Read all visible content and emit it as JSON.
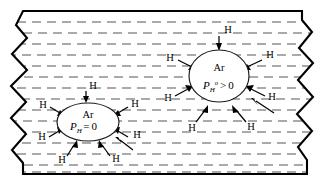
{
  "figure": {
    "colors": {
      "background": "#ffffff",
      "slab_outline": "#000000",
      "dash_line": "#8e8e8e",
      "bubble_fill": "#ffffff",
      "bubble_outline": "#1a1a1a",
      "arrow": "#000000",
      "text": "#000000"
    },
    "slab": {
      "name": "metal-slab",
      "left_edge_style": "zigzag",
      "right_edge_style": "zigzag",
      "top_edge_style": "straight",
      "bottom_edge_style": "straight",
      "hatch_rows": 15
    },
    "bubbles": [
      {
        "id": "left-bubble",
        "species": "Ar",
        "pressure_symbol": "P",
        "pressure_subscript": "H",
        "pressure_superscript": "",
        "relation": "=",
        "pressure_value": "0",
        "pressure_text": "P_H = 0",
        "cx": 88,
        "cy": 122,
        "rx": 31,
        "ry": 19,
        "arrow_count": 8
      },
      {
        "id": "right-bubble",
        "species": "Ar",
        "pressure_symbol": "P",
        "pressure_subscript": "H",
        "pressure_superscript": "o",
        "relation": ">",
        "pressure_value": "0",
        "pressure_text": "P_H^o > 0",
        "cx": 219,
        "cy": 76,
        "rx": 30,
        "ry": 26,
        "arrow_count": 8
      }
    ],
    "hydrogen_label": "H",
    "arrow_direction": "inward",
    "left_arrow_labels": [
      "H",
      "H",
      "H",
      "H",
      "H",
      "H",
      "H",
      "H"
    ],
    "right_arrow_labels": [
      "H",
      "H",
      "H",
      "H",
      "H",
      "H",
      "H",
      "H"
    ]
  }
}
